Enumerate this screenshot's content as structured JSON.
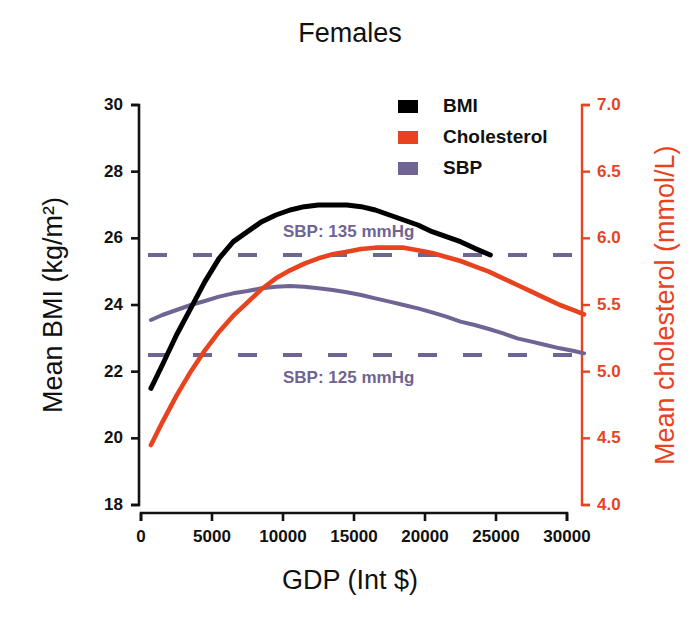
{
  "chart_data": {
    "type": "line",
    "title": "Females",
    "xlabel": "GDP (Int $)",
    "ylabel": "Mean BMI (kg/m²)",
    "y2label": "Mean cholesterol (mmol/L)",
    "xlim": [
      0,
      31500
    ],
    "ylim": [
      18,
      30
    ],
    "y2lim": [
      4.0,
      7.0
    ],
    "xticks": [
      "0",
      "5000",
      "10000",
      "15000",
      "20000",
      "25000",
      "30000"
    ],
    "xtick_values": [
      0,
      5000,
      10000,
      15000,
      20000,
      25000,
      30000
    ],
    "yticks": [
      "18",
      "20",
      "22",
      "24",
      "26",
      "28",
      "30"
    ],
    "ytick_values": [
      18,
      20,
      22,
      24,
      26,
      28,
      30
    ],
    "y2ticks": [
      "4.0",
      "4.5",
      "5.0",
      "5.5",
      "6.0",
      "6.5",
      "7.0"
    ],
    "y2tick_values": [
      4.0,
      4.5,
      5.0,
      5.5,
      6.0,
      6.5,
      7.0
    ],
    "grid": false,
    "legend_position": "top-center-right",
    "series": [
      {
        "name": "BMI",
        "color": "#000000",
        "axis": "left",
        "unit": "kg/m2",
        "x": [
          700,
          1500,
          2500,
          3500,
          4500,
          5500,
          6500,
          7500,
          8500,
          9500,
          10500,
          11500,
          12500,
          13500,
          14500,
          15500,
          16500,
          17500,
          18500,
          19500,
          20500,
          21500,
          22500,
          23500,
          24600
        ],
        "values": [
          21.5,
          22.2,
          23.1,
          23.9,
          24.7,
          25.4,
          25.9,
          26.2,
          26.5,
          26.7,
          26.85,
          26.95,
          27.0,
          27.0,
          27.0,
          26.95,
          26.85,
          26.7,
          26.55,
          26.4,
          26.2,
          26.05,
          25.9,
          25.7,
          25.5
        ]
      },
      {
        "name": "Cholesterol",
        "color": "#E8431F",
        "axis": "right",
        "unit": "mmol/L",
        "x": [
          700,
          1500,
          2500,
          3500,
          4500,
          5500,
          6500,
          7500,
          8500,
          9500,
          10500,
          11500,
          12500,
          13500,
          14500,
          15500,
          16500,
          17500,
          18500,
          19500,
          20500,
          21500,
          22500,
          23500,
          24500,
          25500,
          26500,
          27500,
          28500,
          29500,
          30500,
          31200
        ],
        "values": [
          4.45,
          4.62,
          4.82,
          5.0,
          5.16,
          5.3,
          5.42,
          5.52,
          5.62,
          5.7,
          5.76,
          5.81,
          5.85,
          5.88,
          5.9,
          5.92,
          5.93,
          5.93,
          5.93,
          5.91,
          5.89,
          5.86,
          5.83,
          5.79,
          5.75,
          5.7,
          5.65,
          5.6,
          5.55,
          5.5,
          5.46,
          5.43
        ]
      },
      {
        "name": "SBP",
        "color": "#6F6493",
        "axis": "left_sbp_scale",
        "unit": "mmHg",
        "x": [
          700,
          1500,
          2500,
          3500,
          4500,
          5500,
          6500,
          7500,
          8500,
          9500,
          10500,
          11500,
          12500,
          13500,
          14500,
          15500,
          16500,
          17500,
          18500,
          19500,
          20500,
          21500,
          22500,
          23500,
          24500,
          25500,
          26500,
          27500,
          28500,
          29500,
          30500,
          31200
        ],
        "values_bmi_axis": [
          23.55,
          23.7,
          23.85,
          24.0,
          24.12,
          24.25,
          24.35,
          24.42,
          24.5,
          24.55,
          24.57,
          24.55,
          24.5,
          24.45,
          24.38,
          24.3,
          24.2,
          24.1,
          24.0,
          23.9,
          23.78,
          23.65,
          23.5,
          23.4,
          23.28,
          23.15,
          23.0,
          22.9,
          22.8,
          22.7,
          22.62,
          22.55
        ]
      }
    ],
    "reference_lines": [
      {
        "label": "SBP: 135 mmHg",
        "y_bmi_axis": 25.5,
        "color": "#6F6493",
        "style": "dashed"
      },
      {
        "label": "SBP: 125 mmHg",
        "y_bmi_axis": 22.5,
        "color": "#6F6493",
        "style": "dashed"
      }
    ],
    "legend": [
      {
        "label": "BMI",
        "color": "#000000"
      },
      {
        "label": "Cholesterol",
        "color": "#E8431F"
      },
      {
        "label": "SBP",
        "color": "#6F6493"
      }
    ]
  }
}
